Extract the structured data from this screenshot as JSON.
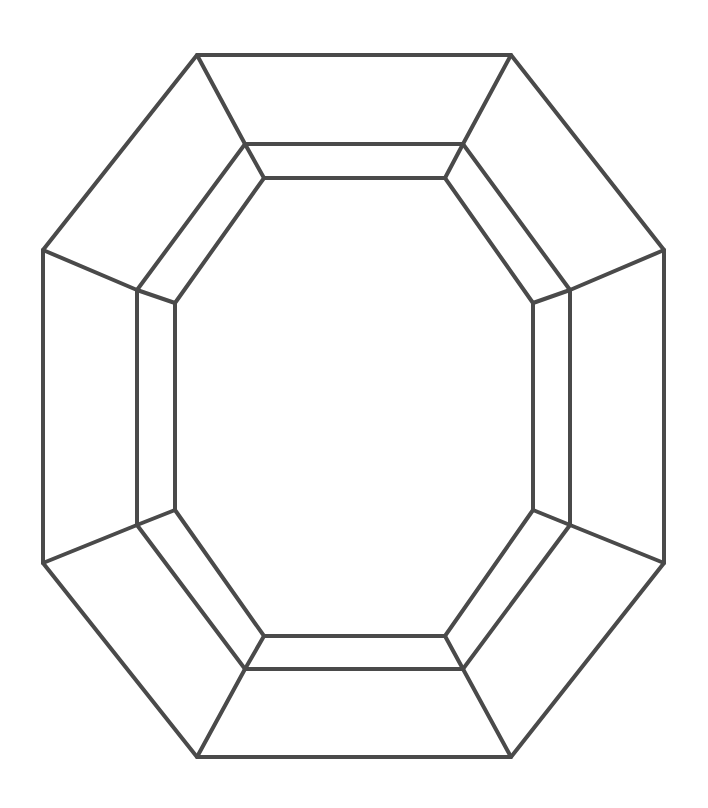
{
  "diagram": {
    "type": "octagonal-gem-outline",
    "stroke_color": "#4a4a4a",
    "stroke_width": 4,
    "background": "#ffffff",
    "octagons": {
      "outer": [
        [
          197,
          55
        ],
        [
          511,
          55
        ],
        [
          664,
          250
        ],
        [
          664,
          563
        ],
        [
          511,
          757
        ],
        [
          197,
          757
        ],
        [
          43,
          563
        ],
        [
          43,
          250
        ]
      ],
      "middle": [
        [
          245,
          144
        ],
        [
          463,
          144
        ],
        [
          570,
          290
        ],
        [
          570,
          525
        ],
        [
          463,
          669
        ],
        [
          245,
          669
        ],
        [
          137,
          525
        ],
        [
          137,
          290
        ]
      ],
      "inner": [
        [
          264,
          178
        ],
        [
          445,
          178
        ],
        [
          533,
          303
        ],
        [
          533,
          510
        ],
        [
          445,
          636
        ],
        [
          264,
          636
        ],
        [
          175,
          510
        ],
        [
          175,
          303
        ]
      ]
    },
    "connectors": [
      {
        "from": "outer",
        "to": "middle"
      },
      {
        "from": "middle",
        "to": "inner"
      }
    ]
  }
}
